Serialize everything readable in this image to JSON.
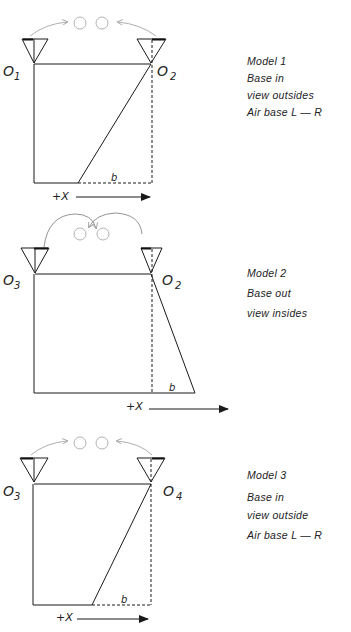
{
  "models": [
    {
      "id": "model-1",
      "caption": [
        "Model 1",
        "Base in",
        "view outsides",
        "Air base  L — R"
      ],
      "left_station": {
        "label": "O",
        "sub": "1"
      },
      "right_station": {
        "label": "O",
        "sub": "2"
      },
      "base_label": "b",
      "axis_label": "+X"
    },
    {
      "id": "model-2",
      "caption": [
        "Model  2",
        "Base out",
        "view insides"
      ],
      "left_station": {
        "label": "O",
        "sub": "3"
      },
      "right_station": {
        "label": "O",
        "sub": "2"
      },
      "base_label": "b",
      "axis_label": "+X"
    },
    {
      "id": "model-3",
      "caption": [
        "Model  3",
        "Base in",
        "view outside",
        "Air base  L — R"
      ],
      "left_station": {
        "label": "O",
        "sub": "3"
      },
      "right_station": {
        "label": "O",
        "sub": "4"
      },
      "base_label": "b",
      "axis_label": "+X"
    }
  ],
  "colors": {
    "line": "#1a1a1a",
    "light": "#9a9a9a"
  }
}
